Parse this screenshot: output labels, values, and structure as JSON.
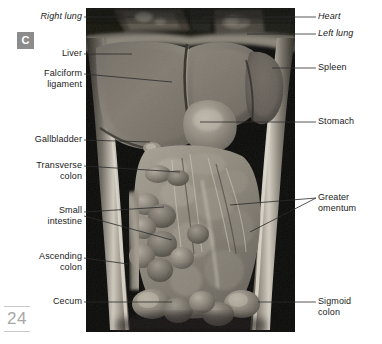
{
  "figure": {
    "panel_letter": "C",
    "page_number": "24",
    "photo_alt": "anterior-abdominal-viscera-cadaver-photograph"
  },
  "labels_left": [
    {
      "id": "right-lung",
      "text": "Right lung",
      "italic": true,
      "x": 8,
      "y": 11,
      "w": 74,
      "lines": 1
    },
    {
      "id": "liver",
      "text": "Liver",
      "italic": false,
      "x": 8,
      "y": 48,
      "w": 74,
      "lines": 1
    },
    {
      "id": "falciform-ligament",
      "text": "Falciform\nligament",
      "italic": false,
      "x": 8,
      "y": 68,
      "w": 74,
      "lines": 2
    },
    {
      "id": "gallbladder",
      "text": "Gallbladder",
      "italic": false,
      "x": 4,
      "y": 134,
      "w": 78,
      "lines": 1
    },
    {
      "id": "transverse-colon",
      "text": "Transverse\ncolon",
      "italic": false,
      "x": 4,
      "y": 160,
      "w": 78,
      "lines": 2
    },
    {
      "id": "small-intestine",
      "text": "Small\nintestine",
      "italic": false,
      "x": 4,
      "y": 205,
      "w": 78,
      "lines": 2
    },
    {
      "id": "ascending-colon",
      "text": "Ascending\ncolon",
      "italic": false,
      "x": 4,
      "y": 251,
      "w": 78,
      "lines": 2
    },
    {
      "id": "cecum",
      "text": "Cecum",
      "italic": false,
      "x": 4,
      "y": 296,
      "w": 78,
      "lines": 1
    }
  ],
  "labels_right": [
    {
      "id": "heart",
      "text": "Heart",
      "italic": true,
      "x": 318,
      "y": 11,
      "lines": 1
    },
    {
      "id": "left-lung",
      "text": "Left lung",
      "italic": true,
      "x": 318,
      "y": 28,
      "lines": 1
    },
    {
      "id": "spleen",
      "text": "Spleen",
      "italic": false,
      "x": 318,
      "y": 62,
      "lines": 1
    },
    {
      "id": "stomach",
      "text": "Stomach",
      "italic": false,
      "x": 318,
      "y": 116,
      "lines": 1
    },
    {
      "id": "greater-omentum",
      "text": "Greater\nomentum",
      "italic": false,
      "x": 318,
      "y": 192,
      "lines": 2
    },
    {
      "id": "sigmoid-colon",
      "text": "Sigmoid\ncolon",
      "italic": false,
      "x": 318,
      "y": 296,
      "lines": 2
    }
  ],
  "leaders": [
    {
      "id": "leader-right-lung",
      "points": "84,17 134,17"
    },
    {
      "id": "leader-liver",
      "points": "84,54 132,54"
    },
    {
      "id": "leader-falciform",
      "points": "84,74 172,82"
    },
    {
      "id": "leader-gallbladder",
      "points": "84,140 150,142"
    },
    {
      "id": "leader-transverse-colon",
      "points": "84,166 180,172"
    },
    {
      "id": "leader-small-intestine-a",
      "points": "84,212 164,207"
    },
    {
      "id": "leader-small-intestine-b",
      "points": "84,216 172,240"
    },
    {
      "id": "leader-ascending-colon",
      "points": "84,258 128,264"
    },
    {
      "id": "leader-cecum",
      "points": "84,302 172,302"
    },
    {
      "id": "leader-heart",
      "points": "316,17 203,17"
    },
    {
      "id": "leader-left-lung",
      "points": "316,34 247,34"
    },
    {
      "id": "leader-spleen",
      "points": "316,68 272,68"
    },
    {
      "id": "leader-stomach",
      "points": "316,122 200,122"
    },
    {
      "id": "leader-greater-omentum-a",
      "points": "316,198 230,205"
    },
    {
      "id": "leader-greater-omentum-b",
      "points": "316,198 250,232"
    },
    {
      "id": "leader-sigmoid-colon",
      "points": "316,302 258,302"
    }
  ]
}
